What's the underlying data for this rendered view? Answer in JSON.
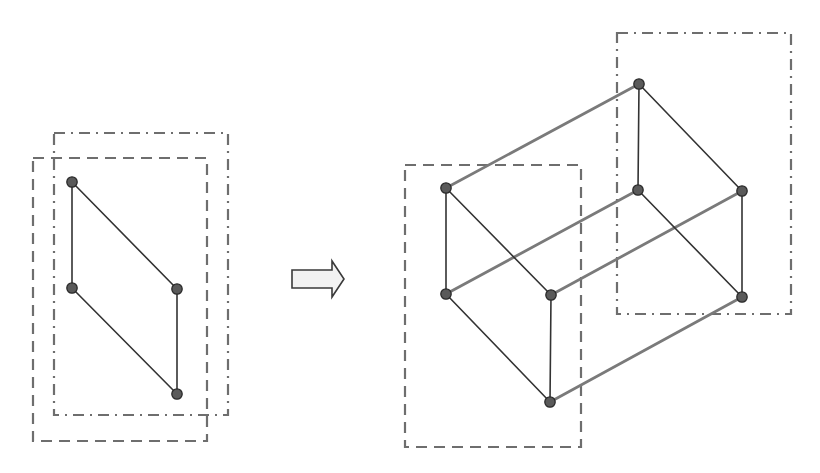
{
  "diagram": {
    "colors": {
      "background": "#ffffff",
      "frame_stroke": "#6e6e6e",
      "edge_dark": "#333333",
      "edge_connector": "#7a7a7a",
      "vertex_fill": "#5a5a5a",
      "vertex_stroke": "#2a2a2a",
      "arrow_fill": "#f2f2f2"
    },
    "left_figure": {
      "dashed_frame": {
        "x": 33,
        "y": 158,
        "w": 174,
        "h": 283
      },
      "dashdot_frame": {
        "x": 54,
        "y": 133,
        "w": 174,
        "h": 282
      },
      "vertices": [
        {
          "x": 72,
          "y": 182
        },
        {
          "x": 72,
          "y": 288
        },
        {
          "x": 177,
          "y": 289
        },
        {
          "x": 177,
          "y": 394
        }
      ]
    },
    "arrow": {
      "icon": "right-block-arrow-icon",
      "points": "292,270 332,270 332,261 344,279 332,297 332,288 292,288"
    },
    "right_figure": {
      "dashed_frame": {
        "x": 405,
        "y": 165,
        "w": 176,
        "h": 282
      },
      "dashdot_frame": {
        "x": 617,
        "y": 33,
        "w": 174,
        "h": 281
      },
      "front_face": [
        {
          "x": 446,
          "y": 188
        },
        {
          "x": 446,
          "y": 294
        },
        {
          "x": 551,
          "y": 295
        },
        {
          "x": 550,
          "y": 402
        }
      ],
      "back_face": [
        {
          "x": 639,
          "y": 84
        },
        {
          "x": 638,
          "y": 190
        },
        {
          "x": 742,
          "y": 191
        },
        {
          "x": 742,
          "y": 297
        }
      ]
    }
  }
}
